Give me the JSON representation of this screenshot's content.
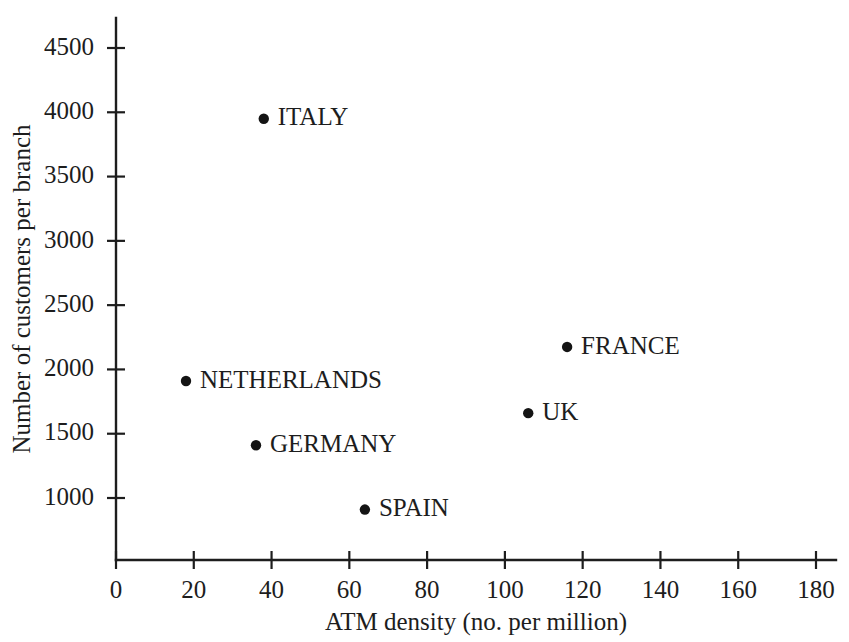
{
  "chart_data": {
    "type": "scatter",
    "title": "",
    "xlabel": "ATM density (no. per million)",
    "ylabel": "Number of customers per branch",
    "xlim": [
      0,
      180
    ],
    "ylim": [
      700,
      4800
    ],
    "grid": false,
    "legend": "none",
    "xticks": [
      0,
      20,
      40,
      60,
      80,
      100,
      120,
      140,
      160,
      180
    ],
    "xtick_labels": [
      "0",
      "20",
      "40",
      "60",
      "80",
      "100",
      "120",
      "140",
      "160",
      "180"
    ],
    "yticks": [
      1000,
      1500,
      2000,
      2500,
      3000,
      3500,
      4000,
      4500
    ],
    "ytick_labels": [
      "1000",
      "1500",
      "2000",
      "2500",
      "3000",
      "3500",
      "4000",
      "4500"
    ],
    "points": [
      {
        "label": "ITALY",
        "x": 38,
        "y": 3950,
        "label_pos": "right"
      },
      {
        "label": "FRANCE",
        "x": 116,
        "y": 2175,
        "label_pos": "right"
      },
      {
        "label": "NETHERLANDS",
        "x": 18,
        "y": 1910,
        "label_pos": "right"
      },
      {
        "label": "UK",
        "x": 106,
        "y": 1660,
        "label_pos": "right"
      },
      {
        "label": "GERMANY",
        "x": 36,
        "y": 1410,
        "label_pos": "right"
      },
      {
        "label": "SPAIN",
        "x": 64,
        "y": 910,
        "label_pos": "right"
      }
    ],
    "colors": {
      "marker": "#141414",
      "axis": "#1d1d1d",
      "text": "#1d1d1d",
      "background": "#ffffff"
    }
  }
}
